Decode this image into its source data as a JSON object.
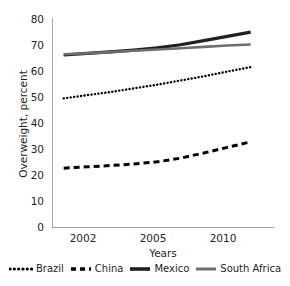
{
  "chart_data": {
    "type": "line",
    "title": "",
    "xlabel": "Years",
    "ylabel": "Overweight, percent",
    "xlim": [
      2001,
      2010.5
    ],
    "ylim": [
      0,
      80
    ],
    "yticks": [
      0,
      10,
      20,
      30,
      40,
      50,
      60,
      70,
      80
    ],
    "xticks": [
      2002,
      2005,
      2010
    ],
    "grid": false,
    "legend_position": "bottom",
    "x": [
      2001.5,
      2002.5,
      2003.5,
      2004.5,
      2005.5,
      2006.5,
      2007.5,
      2008.5,
      2009.5
    ],
    "series": [
      {
        "name": "Brazil",
        "style": "dotted",
        "color": "#000000",
        "width": 2.4,
        "values": [
          49.4,
          50.6,
          51.8,
          53.2,
          54.6,
          56.2,
          57.8,
          59.6,
          61.3
        ]
      },
      {
        "name": "China",
        "style": "dashed",
        "color": "#000000",
        "width": 3.0,
        "values": [
          22.8,
          23.3,
          23.8,
          24.4,
          25.2,
          26.6,
          28.6,
          30.7,
          32.8
        ]
      },
      {
        "name": "Mexico",
        "style": "solid",
        "color": "#231f20",
        "width": 3.2,
        "values": [
          65.9,
          66.5,
          67.1,
          67.8,
          68.6,
          69.8,
          71.4,
          73.0,
          74.6
        ]
      },
      {
        "name": "South Africa",
        "style": "solid",
        "color": "#6d6e71",
        "width": 2.6,
        "values": [
          66.2,
          66.6,
          67.0,
          67.5,
          68.0,
          68.5,
          69.0,
          69.5,
          69.9
        ]
      }
    ]
  },
  "axis": {
    "y_title": "Overweight, percent",
    "x_title": "Years",
    "y_labels": [
      "80",
      "70",
      "60",
      "50",
      "40",
      "30",
      "20",
      "10",
      "0"
    ],
    "x_labels": [
      "2002",
      "2005",
      "2010"
    ]
  },
  "legend": {
    "items": [
      {
        "label": "Brazil"
      },
      {
        "label": "China"
      },
      {
        "label": "Mexico"
      },
      {
        "label": "South Africa"
      }
    ]
  }
}
